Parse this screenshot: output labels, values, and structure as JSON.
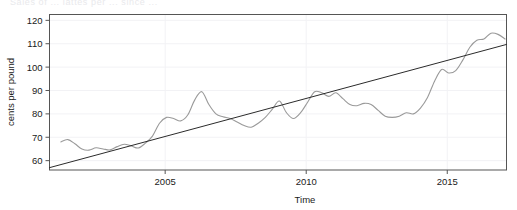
{
  "page": {
    "background_color": "#ffffff",
    "cut_off_header_text": "Sales of ... lattes per ... since ..."
  },
  "chart_data": {
    "type": "line",
    "title": "",
    "subtitle": "",
    "xlabel": "Time",
    "ylabel": "cents per pound",
    "xlim": [
      2000.9,
      2017.1
    ],
    "ylim": [
      56.0,
      122.5
    ],
    "grid": true,
    "grid_color": "#f2f2f5",
    "legend": null,
    "legend_position": "none",
    "x_ticks": [
      2005,
      2010,
      2015
    ],
    "x_tick_labels": [
      "2005",
      "2010",
      "2015"
    ],
    "y_ticks": [
      60,
      70,
      80,
      90,
      100,
      110,
      120
    ],
    "y_tick_labels": [
      "60",
      "70",
      "80",
      "90",
      "100",
      "110",
      "120"
    ],
    "series": [
      {
        "name": "cents per pound",
        "type": "line",
        "color": "#9a9a9a",
        "width": 1.1,
        "x": [
          2001.3,
          2001.55,
          2001.8,
          2002.05,
          2002.3,
          2002.55,
          2002.8,
          2003.05,
          2003.3,
          2003.55,
          2003.8,
          2004.05,
          2004.3,
          2004.55,
          2004.8,
          2005.05,
          2005.3,
          2005.55,
          2005.8,
          2006.05,
          2006.3,
          2006.55,
          2006.8,
          2007.05,
          2007.3,
          2007.55,
          2007.8,
          2008.05,
          2008.3,
          2008.55,
          2008.8,
          2009.05,
          2009.3,
          2009.55,
          2009.8,
          2010.05,
          2010.3,
          2010.55,
          2010.8,
          2011.05,
          2011.3,
          2011.55,
          2011.8,
          2012.05,
          2012.3,
          2012.55,
          2012.8,
          2013.05,
          2013.3,
          2013.55,
          2013.8,
          2014.05,
          2014.3,
          2014.55,
          2014.8,
          2015.05,
          2015.3,
          2015.55,
          2015.8,
          2016.05,
          2016.3,
          2016.55,
          2016.8,
          2017.05
        ],
        "y": [
          68.0,
          69.0,
          67.2,
          65.0,
          64.5,
          65.5,
          65.0,
          64.6,
          66.0,
          67.0,
          66.3,
          65.4,
          67.5,
          70.5,
          76.0,
          78.5,
          78.0,
          77.0,
          79.5,
          86.0,
          89.5,
          84.0,
          80.0,
          78.8,
          78.0,
          76.5,
          75.0,
          74.3,
          76.0,
          78.5,
          82.0,
          85.5,
          80.5,
          78.0,
          80.5,
          85.0,
          89.5,
          89.0,
          87.5,
          89.0,
          86.5,
          84.0,
          83.5,
          84.5,
          84.0,
          81.5,
          79.0,
          78.5,
          79.0,
          80.5,
          80.0,
          82.5,
          87.0,
          94.0,
          99.0,
          97.5,
          98.5,
          103.0,
          108.5,
          111.5,
          112.0,
          114.5,
          114.0,
          112.0
        ]
      },
      {
        "name": "linear trend",
        "type": "line",
        "color": "#2b2b2b",
        "width": 1.0,
        "x": [
          2000.9,
          2017.1
        ],
        "y": [
          57.0,
          109.7
        ]
      }
    ]
  }
}
